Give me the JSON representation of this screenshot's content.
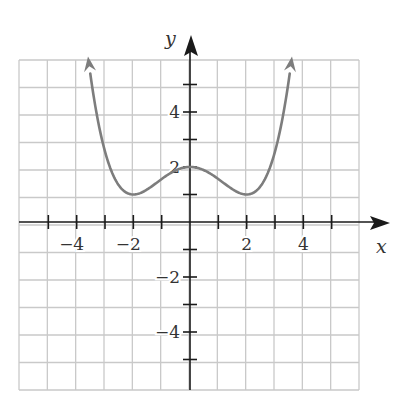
{
  "chart_data": {
    "type": "line",
    "title": "",
    "xlabel": "x",
    "ylabel": "y",
    "xlim": [
      -6,
      6
    ],
    "ylim": [
      -6,
      6
    ],
    "grid": true,
    "x_ticks": [
      -4,
      -2,
      2,
      4
    ],
    "y_ticks": [
      -4,
      -2,
      2,
      4
    ],
    "x_tick_labels": [
      "−4",
      "−2",
      "2",
      "4"
    ],
    "y_tick_labels": [
      "−4",
      "−2",
      "2",
      "4"
    ],
    "series": [
      {
        "name": "f(x)",
        "formula": "y = (x^2 - 4)^2 / 16 + 1",
        "x": [
          -3.6,
          -3.3,
          -3,
          -2.5,
          -2,
          -1.5,
          -1,
          -0.5,
          0,
          0.5,
          1,
          1.5,
          2,
          2.5,
          3,
          3.3,
          3.6
        ],
        "values": [
          6.02,
          3.97,
          2.56,
          1.32,
          1.0,
          1.19,
          1.56,
          1.88,
          2.0,
          1.88,
          1.56,
          1.19,
          1.0,
          1.32,
          2.56,
          3.97,
          6.02
        ],
        "arrows_at_ends": true
      }
    ],
    "key_points": [
      {
        "label": "local max",
        "x": 0,
        "y": 2
      },
      {
        "label": "local min",
        "x": -2,
        "y": 1
      },
      {
        "label": "local min",
        "x": 2,
        "y": 1
      }
    ]
  },
  "colors": {
    "grid": "#c9c9c9",
    "axis": "#1a1a1a",
    "curve": "#7d7d7d",
    "text": "#333333"
  }
}
